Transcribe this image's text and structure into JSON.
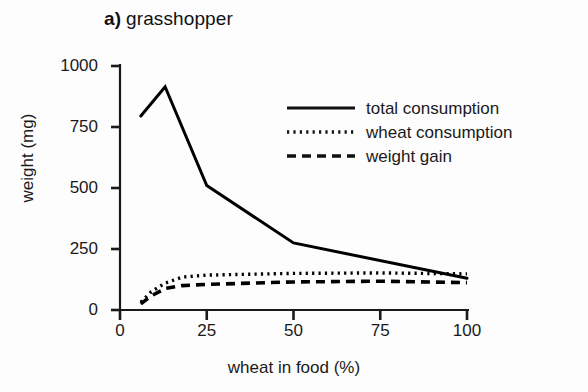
{
  "chart_data": {
    "type": "line",
    "panel_letter": "a)",
    "panel_name": "grasshopper",
    "xlabel": "wheat in food (%)",
    "ylabel": "weight (mg)",
    "xlim": [
      0,
      108
    ],
    "ylim": [
      0,
      1040
    ],
    "xticks": [
      0,
      25,
      50,
      75,
      100
    ],
    "xtick_labels": [
      "0",
      "25",
      "50",
      "75",
      "100"
    ],
    "yticks": [
      0,
      250,
      500,
      750,
      1000
    ],
    "ytick_labels": [
      "0",
      "250",
      "500",
      "750",
      "1000"
    ],
    "grid": false,
    "legend_position": "upper right inside",
    "series": [
      {
        "name": "total consumption",
        "style": "solid",
        "color": "#000000",
        "x": [
          6,
          13,
          25,
          50,
          100
        ],
        "values": [
          795,
          915,
          510,
          275,
          130
        ]
      },
      {
        "name": "wheat consumption",
        "style": "dotted",
        "color": "#000000",
        "x": [
          6,
          9,
          13,
          18,
          25,
          50,
          75,
          100
        ],
        "values": [
          32,
          75,
          110,
          135,
          143,
          150,
          152,
          148
        ]
      },
      {
        "name": "weight gain",
        "style": "dashed",
        "color": "#000000",
        "x": [
          6,
          9,
          13,
          18,
          25,
          50,
          75,
          100
        ],
        "values": [
          25,
          58,
          88,
          100,
          105,
          115,
          118,
          112
        ]
      }
    ]
  },
  "legend": {
    "items": [
      {
        "label": "total consumption",
        "style": "solid"
      },
      {
        "label": "wheat consumption",
        "style": "dotted"
      },
      {
        "label": "weight gain",
        "style": "dashed"
      }
    ]
  },
  "colors": {
    "ink": "#111111",
    "axis": "#1a1a1a",
    "background": "#fdfdfd"
  }
}
